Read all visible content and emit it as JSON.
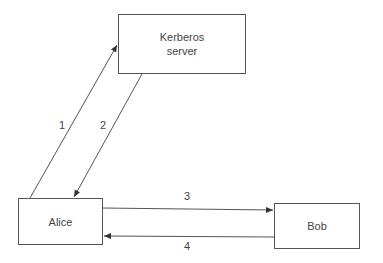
{
  "nodes": {
    "kerberos": {
      "line1": "Kerberos",
      "line2": "server"
    },
    "alice": {
      "label": "Alice"
    },
    "bob": {
      "label": "Bob"
    }
  },
  "edges": [
    {
      "label": "1",
      "from": "Alice",
      "to": "Kerberos server"
    },
    {
      "label": "2",
      "from": "Kerberos server",
      "to": "Alice"
    },
    {
      "label": "3",
      "from": "Alice",
      "to": "Bob"
    },
    {
      "label": "4",
      "from": "Bob",
      "to": "Alice"
    }
  ],
  "colors": {
    "stroke": "#555555",
    "text": "#444444"
  }
}
